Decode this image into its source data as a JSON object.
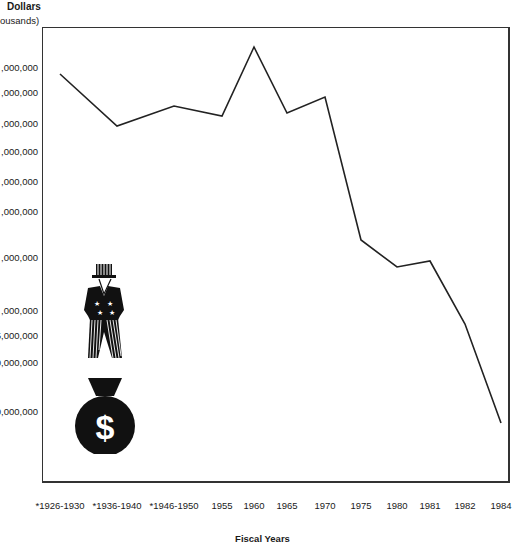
{
  "chart_data": {
    "type": "line",
    "title": "",
    "ylabel": "Dollars",
    "ylabel_sub": "(thousands)",
    "xlabel": "Fiscal Years",
    "grid": false,
    "legend": null,
    "y_tick_labels_visible": [
      ",000,000",
      ",000,000",
      ",000,000",
      ",000,000",
      ",000,000",
      ",000,000",
      ",000,000",
      ",000,000",
      "5,000,000",
      "0,000,000",
      "0,000,000"
    ],
    "y_tick_note": "Leading digits of y-axis tick labels are cropped off in the image; scale appears non-linear",
    "y_tick_positions_px": [
      67,
      92,
      123,
      151,
      181,
      211,
      257,
      310,
      335,
      362,
      411
    ],
    "categories": [
      "*1926-1930",
      "*1936-1940",
      "*1946-1950",
      "1955",
      "1960",
      "1965",
      "1970",
      "1975",
      "1980",
      "1981",
      "1982",
      "1984"
    ],
    "series": [
      {
        "name": "Dollars (thousands)",
        "values_relative_height": [
          0.89,
          0.78,
          0.82,
          0.8,
          0.95,
          0.81,
          0.84,
          0.53,
          0.47,
          0.49,
          0.35,
          0.13
        ],
        "point_px": [
          [
            60,
            74
          ],
          [
            117,
            126
          ],
          [
            174,
            106
          ],
          [
            222,
            116
          ],
          [
            254,
            47
          ],
          [
            287,
            113
          ],
          [
            325,
            97
          ],
          [
            361,
            240
          ],
          [
            397,
            267
          ],
          [
            430,
            261
          ],
          [
            465,
            324
          ],
          [
            501,
            423
          ]
        ]
      }
    ],
    "annotations": [
      "Uncle Sam figure standing on a money bag with a $ sign"
    ]
  },
  "labels": {
    "y_title": "Dollars",
    "y_sub": "ousands)",
    "x_title": "Fiscal Years",
    "dollar_sign": "$"
  }
}
